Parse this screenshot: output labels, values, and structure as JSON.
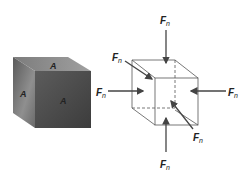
{
  "solid_cube": {
    "face_labels": {
      "top": "A",
      "left": "A",
      "front": "A"
    },
    "colors": {
      "top": "#8a8a8a",
      "left": "#6a6a6a",
      "front": "#4a4a4a"
    }
  },
  "force_cube": {
    "force_symbol": "F",
    "force_subscript": "n",
    "forces": [
      {
        "id": "top",
        "label": "F",
        "sub": "n"
      },
      {
        "id": "bottom",
        "label": "F",
        "sub": "n"
      },
      {
        "id": "left",
        "label": "F",
        "sub": "n"
      },
      {
        "id": "right",
        "label": "F",
        "sub": "n"
      },
      {
        "id": "back",
        "label": "F",
        "sub": "n"
      },
      {
        "id": "front",
        "label": "F",
        "sub": "n"
      }
    ],
    "colors": {
      "edge": "#555555",
      "arrow": "#444444"
    }
  }
}
